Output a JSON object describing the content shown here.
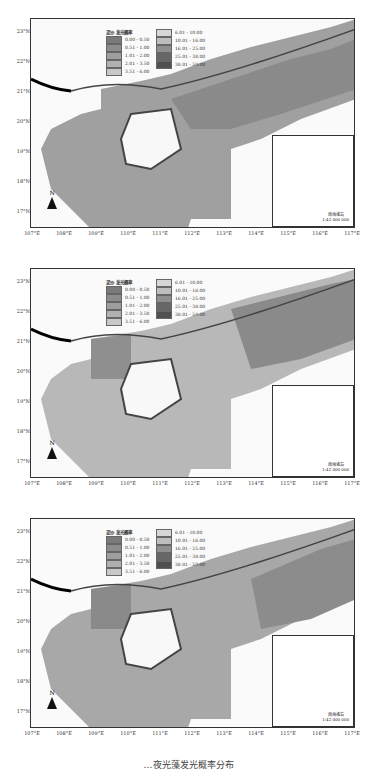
{
  "figure": {
    "caption": "…夜光藻发光概率分布",
    "panels": [
      {
        "id": "a",
        "top": 18
      },
      {
        "id": "b",
        "top": 268
      },
      {
        "id": "c",
        "top": 518
      }
    ]
  },
  "axes": {
    "x_ticks": [
      "107°E",
      "108°E",
      "109°E",
      "110°E",
      "111°E",
      "112°E",
      "113°E",
      "114°E",
      "115°E",
      "116°E",
      "117°E"
    ],
    "y_ticks": [
      "23°N",
      "22°N",
      "21°N",
      "20°N",
      "19°N",
      "18°N",
      "17°N"
    ]
  },
  "legend": {
    "title": "泥沙 发光概率",
    "classes": [
      {
        "range": "0.00 - 0.50",
        "color": "#7a7a7a"
      },
      {
        "range": "0.51 - 1.00",
        "color": "#8c8c8c"
      },
      {
        "range": "1.01 - 2.00",
        "color": "#9e9e9e"
      },
      {
        "range": "2.01 - 3.50",
        "color": "#b0b0b0"
      },
      {
        "range": "3.51 - 6.00",
        "color": "#c8c8c8"
      },
      {
        "range": "6.01 - 10.00",
        "color": "#d6d6d6"
      },
      {
        "range": "10.01 - 16.00",
        "color": "#bdbdbd"
      },
      {
        "range": "16.01 - 25.00",
        "color": "#8f8f8f"
      },
      {
        "range": "25.01 - 38.00",
        "color": "#676767"
      },
      {
        "range": "38.01 - 59.00",
        "color": "#505050"
      }
    ]
  },
  "north_arrow": {
    "label": "N"
  },
  "inset": {
    "title": "南海诸岛",
    "scale": "1:42 000 000"
  },
  "colors": {
    "land": "#fafafa",
    "coast": "#444444",
    "border_line": "#000000"
  }
}
